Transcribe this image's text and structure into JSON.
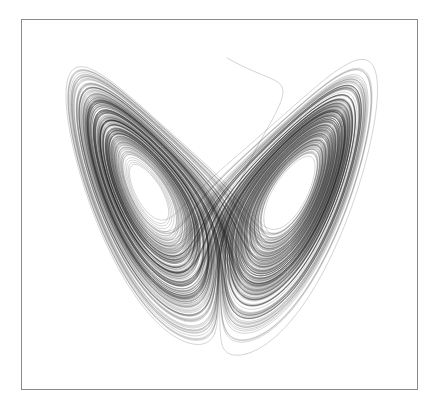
{
  "figure": {
    "kind": "phase-portrait",
    "title": "",
    "background_color": "#ffffff",
    "frame": {
      "border_color": "#8a8a8a",
      "border_width_px": 1,
      "left_px": 21,
      "top_px": 19,
      "width_px": 397,
      "height_px": 371,
      "fill_color": "#ffffff"
    }
  },
  "chart_data": {
    "type": "line",
    "title": "",
    "subtitle": "",
    "xlabel": "",
    "ylabel": "",
    "x_tick_labels": [],
    "y_tick_labels": [],
    "grid": false,
    "legend": [],
    "legend_position": "none",
    "annotations": [],
    "projection": "x-z",
    "system": "Lorenz attractor",
    "equations": [
      "dx/dt = sigma * (y - x)",
      "dy/dt = x * (rho - z) - y",
      "dz/dt = x * y - beta * z"
    ],
    "parameters": {
      "sigma": 10.0,
      "rho": 28.0,
      "beta": 2.6666666667
    },
    "initial_condition": {
      "x": 0.9,
      "y": 16.5,
      "z": 46.5
    },
    "integration": {
      "method": "rk4",
      "dt": 0.0022,
      "steps": 132000
    },
    "xlim": [
      -23.5,
      23.5
    ],
    "ylim": [
      -1.5,
      52.0
    ],
    "series": [
      {
        "name": "trajectory",
        "color": "#1c1c1c",
        "line_width": 0.38,
        "opacity": 0.5
      }
    ],
    "features": [
      {
        "name": "left-lobe-spiral-center",
        "pixel_x": 125,
        "pixel_y": 178,
        "note": "white elliptical hole at left fixed point"
      },
      {
        "name": "right-lobe-spiral-center",
        "pixel_x": 296,
        "pixel_y": 186,
        "note": "larger white elliptical hole at right fixed point"
      },
      {
        "name": "lobe-crossing-region",
        "pixel_x": 222,
        "pixel_y": 163,
        "note": "X shaped crossing where the two wings overlap"
      },
      {
        "name": "transient-tail",
        "pixel_x": 300,
        "pixel_y": 355,
        "note": "outer sweeping arc from initial transient toward lower right"
      }
    ]
  }
}
